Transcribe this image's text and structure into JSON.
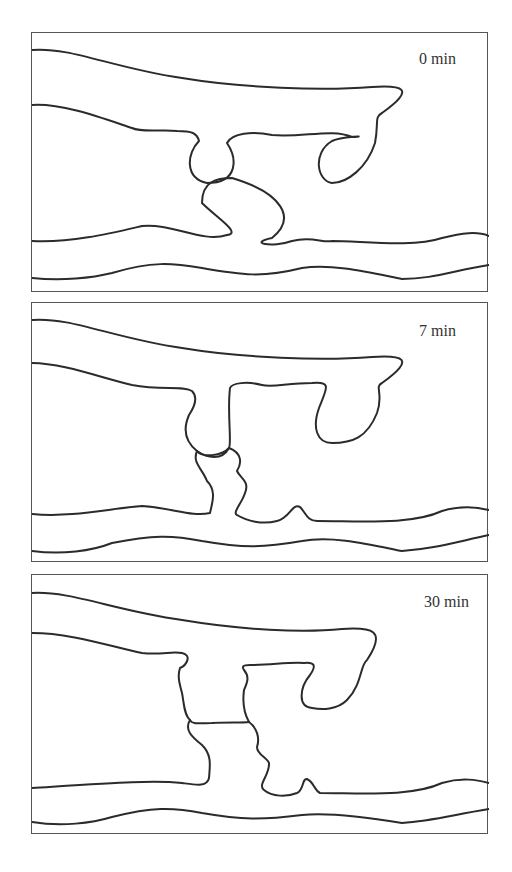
{
  "figure": {
    "panels": [
      {
        "label": "0 min"
      },
      {
        "label": "7 min"
      },
      {
        "label": "30 min"
      }
    ]
  }
}
